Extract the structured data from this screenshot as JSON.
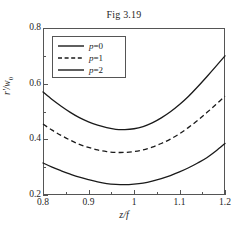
{
  "chart_data": {
    "type": "line",
    "title": "Fig 3.19",
    "xlabel": "z/f",
    "ylabel": "r'/w0",
    "xlim": [
      0.8,
      1.2
    ],
    "ylim": [
      0.2,
      0.8
    ],
    "xticks": [
      "0.8",
      "0.9",
      "1",
      "1.1",
      "1.2"
    ],
    "xtick_values": [
      0.8,
      0.9,
      1.0,
      1.1,
      1.2
    ],
    "yticks": [
      "0.2",
      "0.4",
      "0.6",
      "0.8"
    ],
    "ytick_values": [
      0.2,
      0.4,
      0.6,
      0.8
    ],
    "grid": false,
    "legend_position": "upper left",
    "x": [
      0.8,
      0.82,
      0.84,
      0.86,
      0.88,
      0.9,
      0.92,
      0.94,
      0.96,
      0.98,
      1.0,
      1.02,
      1.04,
      1.06,
      1.08,
      1.1,
      1.12,
      1.14,
      1.16,
      1.18,
      1.2
    ],
    "series": [
      {
        "name": "p=0",
        "style": "solid",
        "color": "#1a1a1a",
        "values": [
          0.315,
          0.3,
          0.287,
          0.275,
          0.264,
          0.255,
          0.247,
          0.241,
          0.238,
          0.237,
          0.239,
          0.243,
          0.25,
          0.259,
          0.27,
          0.283,
          0.298,
          0.315,
          0.334,
          0.358,
          0.385
        ]
      },
      {
        "name": "p=1",
        "style": "dashed",
        "color": "#1a1a1a",
        "values": [
          0.455,
          0.433,
          0.414,
          0.397,
          0.382,
          0.371,
          0.362,
          0.356,
          0.353,
          0.353,
          0.356,
          0.362,
          0.372,
          0.385,
          0.401,
          0.42,
          0.443,
          0.468,
          0.496,
          0.525,
          0.555
        ]
      },
      {
        "name": "p=2",
        "style": "solid",
        "color": "#1a1a1a",
        "values": [
          0.57,
          0.543,
          0.519,
          0.497,
          0.478,
          0.463,
          0.451,
          0.442,
          0.436,
          0.435,
          0.438,
          0.446,
          0.459,
          0.477,
          0.499,
          0.525,
          0.555,
          0.589,
          0.625,
          0.662,
          0.7
        ]
      }
    ]
  },
  "legend": {
    "entries": [
      {
        "label_var": "p",
        "label_eq": "=0",
        "style": "solid"
      },
      {
        "label_var": "p",
        "label_eq": "=1",
        "style": "dashed"
      },
      {
        "label_var": "p",
        "label_eq": "=2",
        "style": "solid"
      }
    ]
  },
  "axis": {
    "y_title_main": "r'/w",
    "y_title_sub": "0"
  }
}
